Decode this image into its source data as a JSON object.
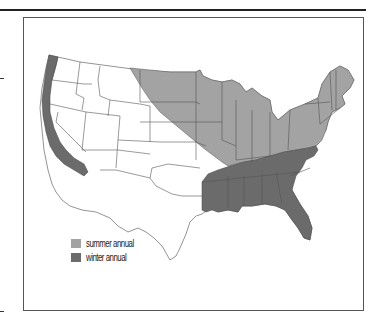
{
  "figure": {
    "type": "choropleth map",
    "region": "Contiguous United States"
  },
  "colors": {
    "summer_annual": "#a3a3a3",
    "winter_annual": "#6b6b6b",
    "state_border": "#444444",
    "background": "#ffffff"
  },
  "legend": {
    "items": [
      {
        "label": "summer annual",
        "color": "#a3a3a3"
      },
      {
        "label": "winter annual",
        "color": "#6b6b6b"
      }
    ]
  },
  "regions": {
    "summer_annual": "Northern Great Plains, Upper Midwest, Great Lakes, Ohio Valley, Mid-Atlantic and New England",
    "winter_annual": "Southeastern US (Gulf states to Virginia) and Pacific coast strip (WA, OR, CA)"
  }
}
